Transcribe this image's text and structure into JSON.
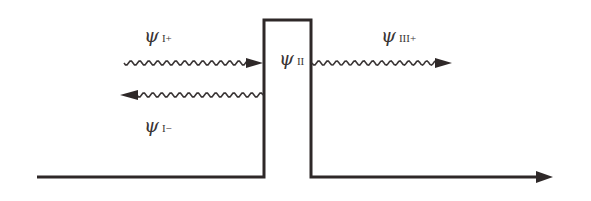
{
  "diagram": {
    "type": "potential-barrier-tunneling",
    "colors": {
      "line": "#2e2828",
      "wave": "#3a3535",
      "label": "#3a3535",
      "background": "#ffffff"
    },
    "labels": {
      "incident": {
        "symbol": "ψ",
        "subscript": "I+"
      },
      "reflected": {
        "symbol": "ψ",
        "subscript": "I−"
      },
      "barrier": {
        "symbol": "ψ",
        "subscript": "II"
      },
      "transmitted": {
        "symbol": "ψ",
        "subscript": "III+"
      }
    },
    "geometry": {
      "baseline_y": 177,
      "barrier": {
        "x_left": 264,
        "x_right": 311,
        "y_top": 20
      },
      "axis": {
        "x_start": 37,
        "x_end": 553
      },
      "incident_wave": {
        "y": 63,
        "x_start": 124,
        "x_end": 263,
        "direction": "right"
      },
      "reflected_wave": {
        "y": 95,
        "x_start": 120,
        "x_end": 263,
        "direction": "left"
      },
      "transmitted_wave": {
        "y": 63,
        "x_start": 312,
        "x_end": 452,
        "direction": "right"
      }
    }
  }
}
